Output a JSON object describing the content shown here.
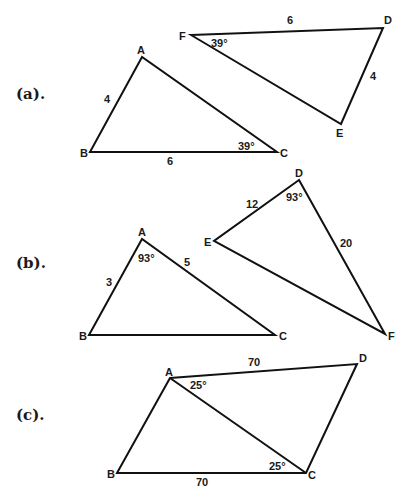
{
  "colors": {
    "line": "#111111",
    "text": "#1a1a1a",
    "background": "#ffffff"
  },
  "parts": [
    {
      "label": "(a).",
      "triangles": [
        {
          "name": "ABC",
          "vertices": {
            "A": "A",
            "B": "B",
            "C": "C"
          },
          "sides": {
            "AB": "4",
            "BC": "6"
          },
          "angles": {
            "C": "39°"
          }
        },
        {
          "name": "FDE",
          "vertices": {
            "F": "F",
            "D": "D",
            "E": "E"
          },
          "sides": {
            "FD": "6",
            "DE": "4"
          },
          "angles": {
            "F": "39°"
          }
        }
      ]
    },
    {
      "label": "(b).",
      "triangles": [
        {
          "name": "ABC",
          "vertices": {
            "A": "A",
            "B": "B",
            "C": "C"
          },
          "sides": {
            "AB": "3",
            "AC": "5"
          },
          "angles": {
            "A": "93°"
          }
        },
        {
          "name": "DEF",
          "vertices": {
            "D": "D",
            "E": "E",
            "F": "F"
          },
          "sides": {
            "ED": "12",
            "DF": "20"
          },
          "angles": {
            "D": "93°"
          }
        }
      ]
    },
    {
      "label": "(c).",
      "quadrilateral": {
        "name": "ABCD",
        "vertices": {
          "A": "A",
          "B": "B",
          "C": "C",
          "D": "D"
        },
        "sides": {
          "AD": "70",
          "BC": "70"
        },
        "angles": {
          "DAC": "25°",
          "BCA": "25°"
        }
      }
    }
  ]
}
